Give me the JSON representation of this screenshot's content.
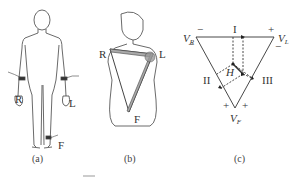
{
  "figure": {
    "panels": [
      {
        "id": "a",
        "caption": "(a)",
        "description": "Full-body figure with limb electrodes",
        "labels": {
          "right_arm": "R",
          "left_arm": "L",
          "foot": "F"
        }
      },
      {
        "id": "b",
        "caption": "(b)",
        "description": "Torso with Einthoven triangle",
        "labels": {
          "right": "R",
          "left": "L",
          "foot": "F"
        }
      },
      {
        "id": "c",
        "caption": "(c)",
        "description": "Einthoven triangle with lead vectors",
        "labels": {
          "vr": "V",
          "vr_sub": "R",
          "vl": "V",
          "vl_sub": "L",
          "vf": "V",
          "vf_sub": "F",
          "lead1": "I",
          "lead2": "II",
          "lead3": "III",
          "heart_vector": "H",
          "plus": "+",
          "minus": "−"
        }
      }
    ],
    "bottom_caption_fragment": "图"
  },
  "colors": {
    "line": "#333333",
    "fill_gray": "#999999",
    "background": "#ffffff"
  }
}
